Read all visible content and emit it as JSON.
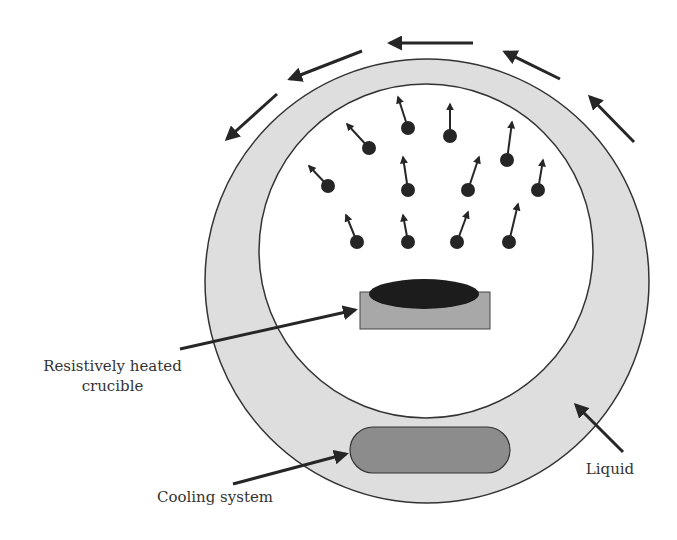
{
  "figure": {
    "colors": {
      "liquid_ring": "#dedede",
      "outline": "#333333",
      "crucible": "#a8a8a8",
      "melt": "#1c1c1c",
      "cooling_system": "#8c8c8c",
      "particles": "#262626"
    },
    "labels": {
      "crucible_line1": "Resistively heated",
      "crucible_line2": "crucible",
      "cooling": "Cooling system",
      "liquid": "Liquid"
    },
    "flow_arrows_count": 5,
    "particles_count": 14
  }
}
